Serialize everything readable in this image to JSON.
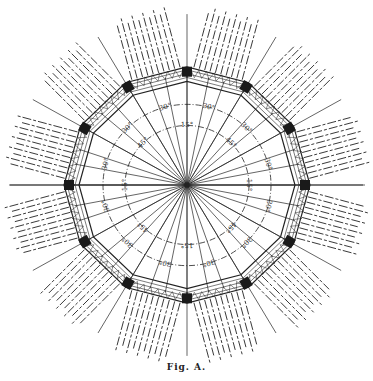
{
  "figure": {
    "caption": "Fig. A.",
    "center": [
      187,
      185
    ],
    "polygon_sides": 12,
    "polygon_radius": 118,
    "inner_circle_radius": 62,
    "outer_circle_radius": 84,
    "colors": {
      "ink": "#222222",
      "node": "#1a1a1a",
      "paper": "#ffffff"
    },
    "inner_circle_labels": [
      "15°",
      "45°",
      "15°",
      "45°",
      "15°",
      "45°",
      "15°",
      "45°"
    ],
    "outer_circle_labels": [
      "30°",
      "30°",
      "30°",
      "30°",
      "30°",
      "30°",
      "30°",
      "30°",
      "30°",
      "30°",
      "30°",
      "30°"
    ]
  }
}
